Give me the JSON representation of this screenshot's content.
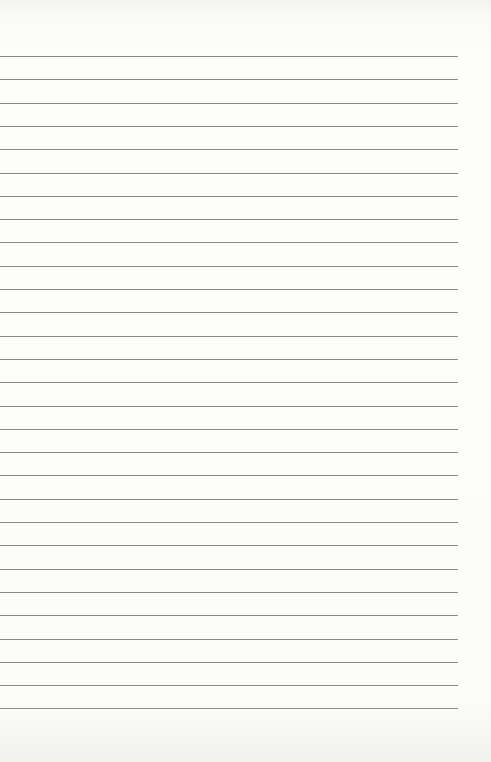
{
  "page": {
    "type": "lined-paper",
    "background_color": "#fbfbfa",
    "line_color": "#8a8a8a",
    "line_count": 29,
    "first_line_y": 56,
    "line_spacing": 23.3,
    "line_left": 0,
    "line_right": 458
  }
}
